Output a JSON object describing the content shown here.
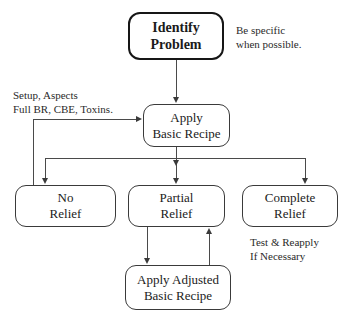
{
  "diagram": {
    "background_color": "#ffffff",
    "line_color": "#4a4a4a",
    "text_color": "#1b1b1b",
    "nodes": [
      {
        "id": "identify-problem",
        "line1": "Identify",
        "line2": "Problem",
        "emphasis": "bold"
      },
      {
        "id": "apply-basic-recipe",
        "line1": "Apply",
        "line2": "Basic Recipe",
        "emphasis": "normal"
      },
      {
        "id": "no-relief",
        "line1": "No",
        "line2": "Relief",
        "emphasis": "normal"
      },
      {
        "id": "partial-relief",
        "line1": "Partial",
        "line2": "Relief",
        "emphasis": "normal"
      },
      {
        "id": "complete-relief",
        "line1": "Complete",
        "line2": "Relief",
        "emphasis": "normal"
      },
      {
        "id": "apply-adjusted-basic-recipe",
        "line1": "Apply Adjusted",
        "line2": "Basic Recipe",
        "emphasis": "normal"
      }
    ],
    "annotations": [
      {
        "id": "be-specific-note",
        "line1": "Be specific",
        "line2": "when possible."
      },
      {
        "id": "setup-aspects-note",
        "line1": "Setup, Aspects",
        "line2": "Full BR, CBE, Toxins."
      },
      {
        "id": "test-reapply-note",
        "line1": "Test & Reapply",
        "line2": "If Necessary"
      }
    ]
  }
}
